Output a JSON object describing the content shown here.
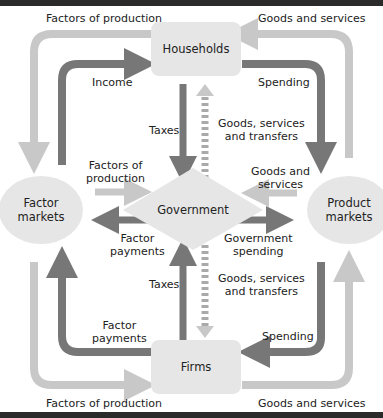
{
  "diagram": {
    "nodes": {
      "households": "Households",
      "firms": "Firms",
      "government": "Government",
      "factor_markets_1": "Factor",
      "factor_markets_2": "markets",
      "product_markets_1": "Product",
      "product_markets_2": "markets"
    },
    "labels": {
      "top_left": "Factors of production",
      "top_right": "Goods and services",
      "bottom_left": "Factors of production",
      "bottom_right": "Goods and services",
      "income": "Income",
      "spending_top": "Spending",
      "spending_bottom": "Spending",
      "taxes_top": "Taxes",
      "taxes_bottom": "Taxes",
      "gst_top_1": "Goods, services",
      "gst_top_2": "and transfers",
      "gst_bottom_1": "Goods, services",
      "gst_bottom_2": "and transfers",
      "fop_mid_1": "Factors of",
      "fop_mid_2": "production",
      "fp_mid_1": "Factor",
      "fp_mid_2": "payments",
      "gs_mid_1": "Goods and",
      "gs_mid_2": "services",
      "gov_spending_1": "Government",
      "gov_spending_2": "spending",
      "fp_bottom_1": "Factor",
      "fp_bottom_2": "payments"
    },
    "colors": {
      "light_flow": "#c8c8c8",
      "dark_flow": "#777777",
      "node_fill": "#e6e6e6",
      "frame": "#2a2a2a"
    }
  }
}
